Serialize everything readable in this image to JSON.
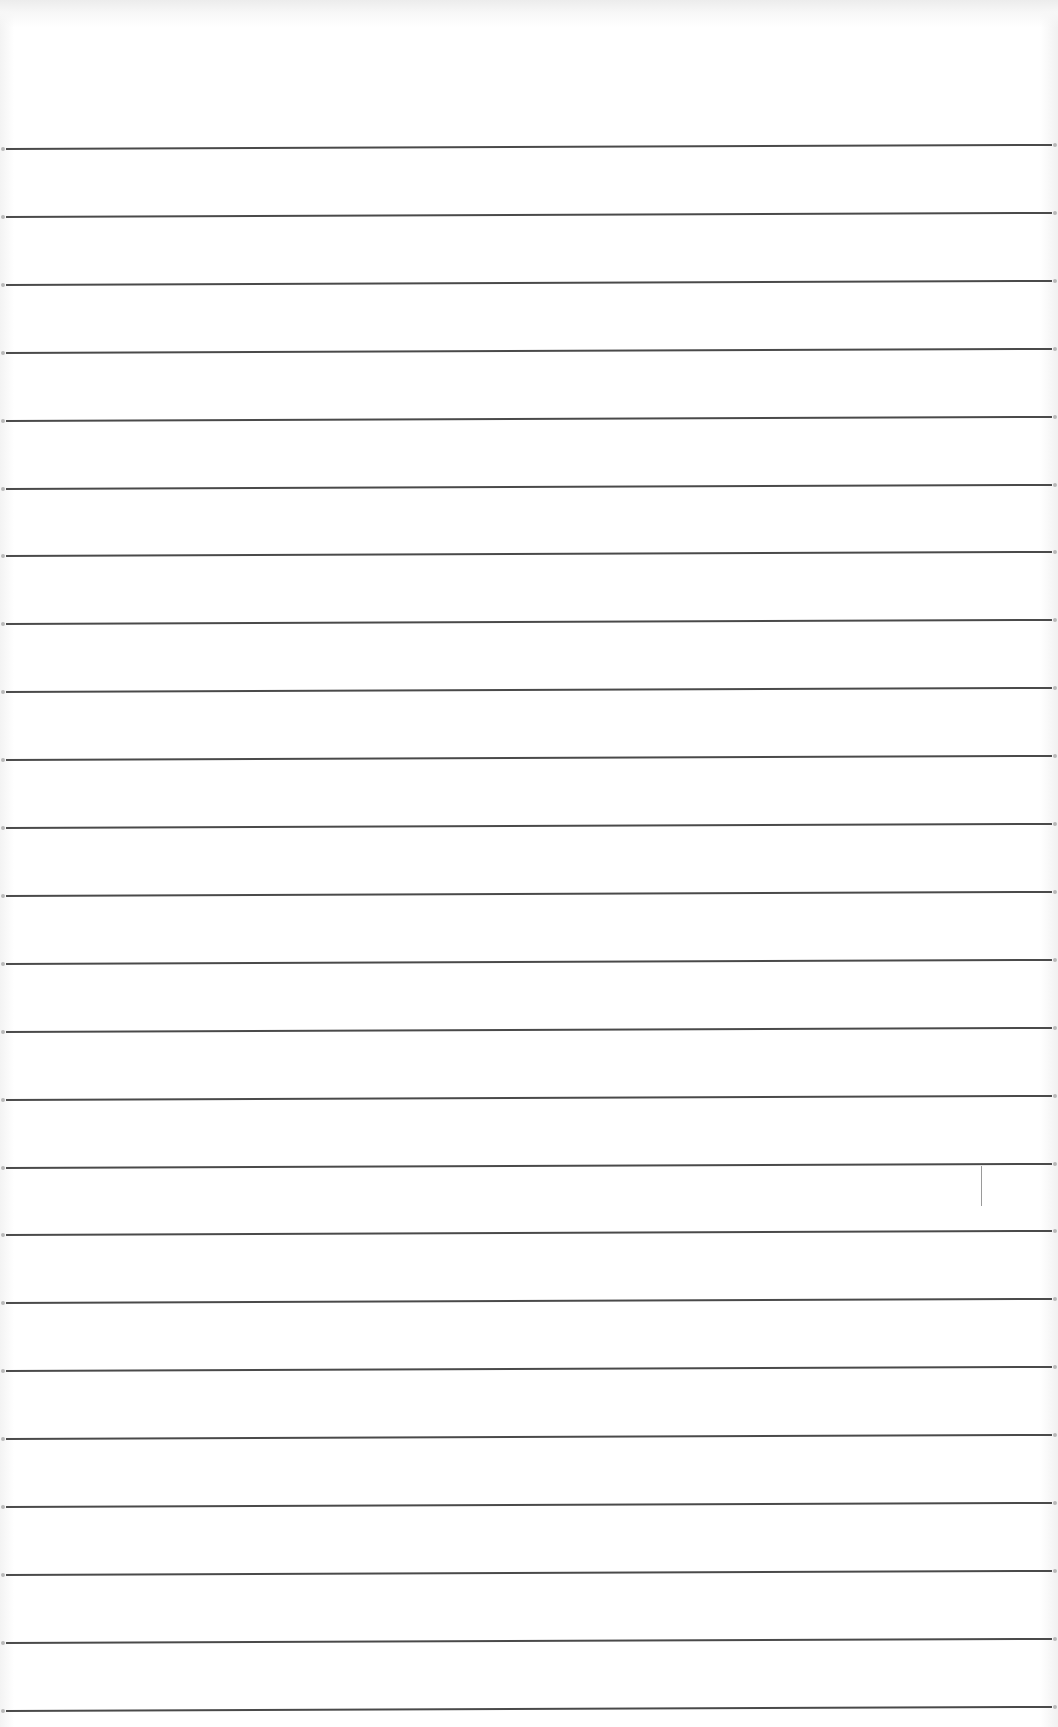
{
  "page": {
    "type": "lined-paper",
    "background_color": "#ffffff",
    "rule_color": "#4a4a4a",
    "rule_count": 24,
    "first_rule_y": 148,
    "rule_spacing": 67.9,
    "text_content": []
  },
  "marks": [
    {
      "name": "stray-pencil-mark",
      "x": 981,
      "y": 1166,
      "height": 40
    }
  ]
}
